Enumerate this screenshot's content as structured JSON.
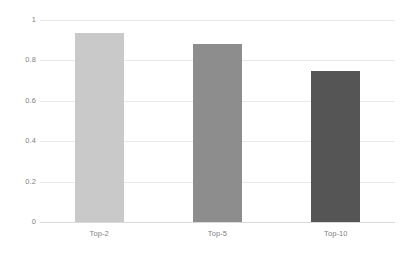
{
  "chart_data": {
    "type": "bar",
    "title": "",
    "subtitle": "",
    "xlabel": "",
    "ylabel": "",
    "categories": [
      "Top-2",
      "Top-5",
      "Top-10"
    ],
    "values": [
      0.935,
      0.88,
      0.75
    ],
    "series": [
      {
        "name": "",
        "values": [
          0.935,
          0.88,
          0.75
        ]
      }
    ],
    "ylim": [
      0,
      1
    ],
    "ytick_labels": [
      "1",
      "0.8",
      "0.6",
      "0.4",
      "0.2",
      "0"
    ],
    "ytick_values": [
      1,
      0.8,
      0.6,
      0.4,
      0.2,
      0
    ],
    "grid": true,
    "grid_axis": "y",
    "legend": false,
    "legend_position": "none",
    "bar_colors": [
      "#c9c9c9",
      "#8d8d8d",
      "#555555"
    ],
    "grid_color": "#e9e9e9",
    "axis_color": "#d9d9d9",
    "tick_label_color": "#7f7f7f",
    "background_color": "#ffffff"
  },
  "axis": {
    "y": {
      "ticks": [
        {
          "label": "1",
          "value": 1
        },
        {
          "label": "0.8",
          "value": 0.8
        },
        {
          "label": "0.6",
          "value": 0.6
        },
        {
          "label": "0.4",
          "value": 0.4
        },
        {
          "label": "0.2",
          "value": 0.2
        },
        {
          "label": "0",
          "value": 0
        }
      ]
    },
    "x": {
      "ticks": [
        {
          "label": "Top-2"
        },
        {
          "label": "Top-5"
        },
        {
          "label": "Top-10"
        }
      ]
    }
  }
}
